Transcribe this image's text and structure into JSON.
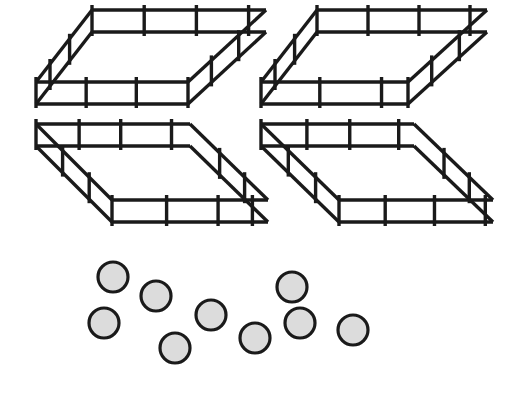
{
  "illustration": {
    "title": "Fence pens and counters",
    "background_color": "#ffffff",
    "line_color": "#1a1a1a",
    "token_fill_color": "#dcdcdc",
    "pen_count_label": "4",
    "token_count_label": "9"
  },
  "pens": {
    "label": "Fence pens",
    "count": 4,
    "rail_count_per_side": 2,
    "items": [
      {
        "name": "pen-top-left",
        "label": "Pen 1",
        "orientation": "back-right",
        "bounds": {
          "x": 33,
          "y": 20,
          "w": 240,
          "h": 94
        },
        "geometry": {
          "front_left": [
            36,
            104
          ],
          "front_right": [
            188,
            104
          ],
          "back_left": [
            92,
            32
          ],
          "back_right": [
            266,
            32
          ],
          "post_height": 22,
          "front_posts_t": [
            0.0,
            0.33,
            0.66,
            1.0
          ],
          "back_posts_t": [
            0.0,
            0.3,
            0.6,
            0.9
          ],
          "left_posts_t": [
            0.25,
            0.6
          ],
          "right_posts_t": [
            0.3,
            0.65
          ]
        }
      },
      {
        "name": "pen-top-right",
        "label": "Pen 2",
        "orientation": "back-right",
        "bounds": {
          "x": 258,
          "y": 20,
          "w": 235,
          "h": 94
        },
        "geometry": {
          "front_left": [
            261,
            104
          ],
          "front_right": [
            408,
            104
          ],
          "back_left": [
            317,
            32
          ],
          "back_right": [
            487,
            32
          ],
          "post_height": 22,
          "front_posts_t": [
            0.0,
            0.4,
            0.82,
            1.0
          ],
          "back_posts_t": [
            0.0,
            0.3,
            0.6,
            0.9
          ],
          "left_posts_t": [
            0.25,
            0.6
          ],
          "right_posts_t": [
            0.3,
            0.65
          ]
        }
      },
      {
        "name": "pen-bottom-left",
        "label": "Pen 3",
        "orientation": "back-left",
        "bounds": {
          "x": 33,
          "y": 138,
          "w": 240,
          "h": 94
        },
        "geometry": {
          "front_left": [
            112,
            222
          ],
          "front_right": [
            268,
            222
          ],
          "back_left": [
            36,
            146
          ],
          "back_right": [
            190,
            146
          ],
          "post_height": 22,
          "front_posts_t": [
            0.0,
            0.35,
            0.68,
            0.9
          ],
          "back_posts_t": [
            0.0,
            0.28,
            0.55,
            0.88
          ],
          "left_posts_t": [
            0.3,
            0.65
          ],
          "right_posts_t": [
            0.3,
            0.62
          ]
        }
      },
      {
        "name": "pen-bottom-right",
        "label": "Pen 4",
        "orientation": "back-left",
        "bounds": {
          "x": 258,
          "y": 138,
          "w": 238,
          "h": 94
        },
        "geometry": {
          "front_left": [
            339,
            222
          ],
          "front_right": [
            493,
            222
          ],
          "back_left": [
            261,
            146
          ],
          "back_right": [
            414,
            146
          ],
          "post_height": 22,
          "front_posts_t": [
            0.0,
            0.3,
            0.62,
            0.95
          ],
          "back_posts_t": [
            0.0,
            0.3,
            0.58,
            0.9
          ],
          "left_posts_t": [
            0.3,
            0.65
          ],
          "right_posts_t": [
            0.3,
            0.62
          ]
        }
      }
    ]
  },
  "tokens": {
    "label": "Counters",
    "count": 9,
    "radius": 15,
    "items": [
      {
        "name": "token-1",
        "label": "Counter 1",
        "cx": 113,
        "cy": 277
      },
      {
        "name": "token-2",
        "label": "Counter 2",
        "cx": 156,
        "cy": 296
      },
      {
        "name": "token-3",
        "label": "Counter 3",
        "cx": 104,
        "cy": 323
      },
      {
        "name": "token-4",
        "label": "Counter 4",
        "cx": 211,
        "cy": 315
      },
      {
        "name": "token-5",
        "label": "Counter 5",
        "cx": 175,
        "cy": 348
      },
      {
        "name": "token-6",
        "label": "Counter 6",
        "cx": 255,
        "cy": 338
      },
      {
        "name": "token-7",
        "label": "Counter 7",
        "cx": 292,
        "cy": 287
      },
      {
        "name": "token-8",
        "label": "Counter 8",
        "cx": 300,
        "cy": 323
      },
      {
        "name": "token-9",
        "label": "Counter 9",
        "cx": 353,
        "cy": 330
      }
    ]
  }
}
